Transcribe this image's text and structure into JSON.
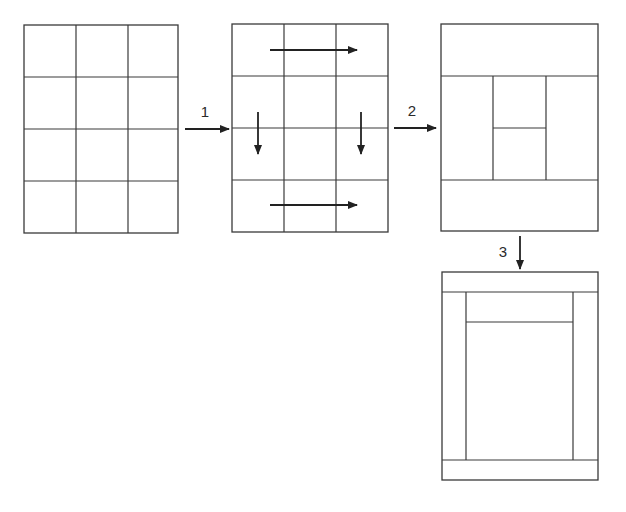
{
  "diagram": {
    "stroke_color": "#3a3a3a",
    "arrow_color": "#222222",
    "background": "#ffffff",
    "panels": [
      {
        "id": "panel-1-initial-grid",
        "description": "4 rows x 3 columns uniform grid",
        "box": {
          "x": 24,
          "y": 25,
          "w": 154,
          "h": 208
        },
        "lines": [
          {
            "x1": 76,
            "y1": 25,
            "x2": 76,
            "y2": 233
          },
          {
            "x1": 128,
            "y1": 25,
            "x2": 128,
            "y2": 233
          },
          {
            "x1": 24,
            "y1": 77,
            "x2": 178,
            "y2": 77
          },
          {
            "x1": 24,
            "y1": 129,
            "x2": 178,
            "y2": 129
          },
          {
            "x1": 24,
            "y1": 181,
            "x2": 178,
            "y2": 181
          }
        ],
        "arrows": []
      },
      {
        "id": "panel-2-grid-with-moves",
        "description": "4x3 grid with arrows indicating cell merges",
        "box": {
          "x": 232,
          "y": 24,
          "w": 156,
          "h": 208
        },
        "lines": [
          {
            "x1": 284,
            "y1": 24,
            "x2": 284,
            "y2": 232
          },
          {
            "x1": 336,
            "y1": 24,
            "x2": 336,
            "y2": 232
          },
          {
            "x1": 232,
            "y1": 76,
            "x2": 388,
            "y2": 76
          },
          {
            "x1": 232,
            "y1": 128,
            "x2": 388,
            "y2": 128
          },
          {
            "x1": 232,
            "y1": 180,
            "x2": 388,
            "y2": 180
          }
        ],
        "arrows": [
          {
            "name": "merge-top-row-arrow",
            "x1": 270,
            "y1": 50,
            "x2": 357,
            "y2": 50
          },
          {
            "name": "merge-left-column-arrow",
            "x1": 258,
            "y1": 112,
            "x2": 258,
            "y2": 154
          },
          {
            "name": "merge-right-column-arrow",
            "x1": 361,
            "y1": 112,
            "x2": 361,
            "y2": 154
          },
          {
            "name": "merge-bottom-row-arrow",
            "x1": 270,
            "y1": 205,
            "x2": 357,
            "y2": 205
          }
        ]
      },
      {
        "id": "panel-3-merged-layout",
        "description": "Merged layout: full-width top and bottom bands, tall left and right columns, two center cells",
        "box": {
          "x": 441,
          "y": 24,
          "w": 157,
          "h": 207
        },
        "lines": [
          {
            "x1": 441,
            "y1": 76,
            "x2": 598,
            "y2": 76
          },
          {
            "x1": 441,
            "y1": 180,
            "x2": 598,
            "y2": 180
          },
          {
            "x1": 493,
            "y1": 76,
            "x2": 493,
            "y2": 180
          },
          {
            "x1": 546,
            "y1": 76,
            "x2": 546,
            "y2": 180
          },
          {
            "x1": 493,
            "y1": 128,
            "x2": 546,
            "y2": 128
          }
        ],
        "arrows": []
      },
      {
        "id": "panel-4-final-layout",
        "description": "Final layout: thin header and footer bands, narrow side columns, small top center cell, large main content cell",
        "box": {
          "x": 442,
          "y": 272,
          "w": 156,
          "h": 208
        },
        "lines": [
          {
            "x1": 442,
            "y1": 292,
            "x2": 598,
            "y2": 292
          },
          {
            "x1": 442,
            "y1": 460,
            "x2": 598,
            "y2": 460
          },
          {
            "x1": 466,
            "y1": 292,
            "x2": 466,
            "y2": 460
          },
          {
            "x1": 573,
            "y1": 292,
            "x2": 573,
            "y2": 460
          },
          {
            "x1": 466,
            "y1": 322,
            "x2": 573,
            "y2": 322
          }
        ],
        "arrows": []
      }
    ],
    "transitions": [
      {
        "label": "1",
        "label_pos": {
          "x": 205,
          "y": 117
        },
        "arrow": {
          "x1": 185,
          "y1": 129,
          "x2": 229,
          "y2": 129
        }
      },
      {
        "label": "2",
        "label_pos": {
          "x": 412,
          "y": 116
        },
        "arrow": {
          "x1": 394,
          "y1": 128,
          "x2": 436,
          "y2": 128
        }
      },
      {
        "label": "3",
        "label_pos": {
          "x": 503,
          "y": 257
        },
        "arrow": {
          "x1": 520,
          "y1": 236,
          "x2": 520,
          "y2": 269
        }
      }
    ]
  }
}
